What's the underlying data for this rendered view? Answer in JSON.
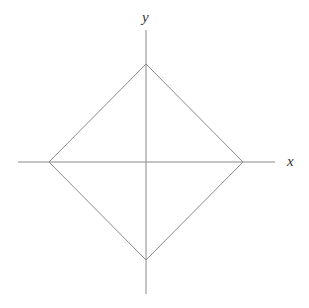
{
  "diagram": {
    "axes": {
      "x_label": "x",
      "y_label": "y",
      "color": "#8a8a8a"
    },
    "shape": {
      "type": "diamond",
      "color": "#8a8a8a",
      "vertices": {
        "top": [
          146,
          64
        ],
        "right": [
          243,
          162
        ],
        "bottom": [
          146,
          260
        ],
        "left": [
          49,
          162
        ]
      }
    }
  }
}
